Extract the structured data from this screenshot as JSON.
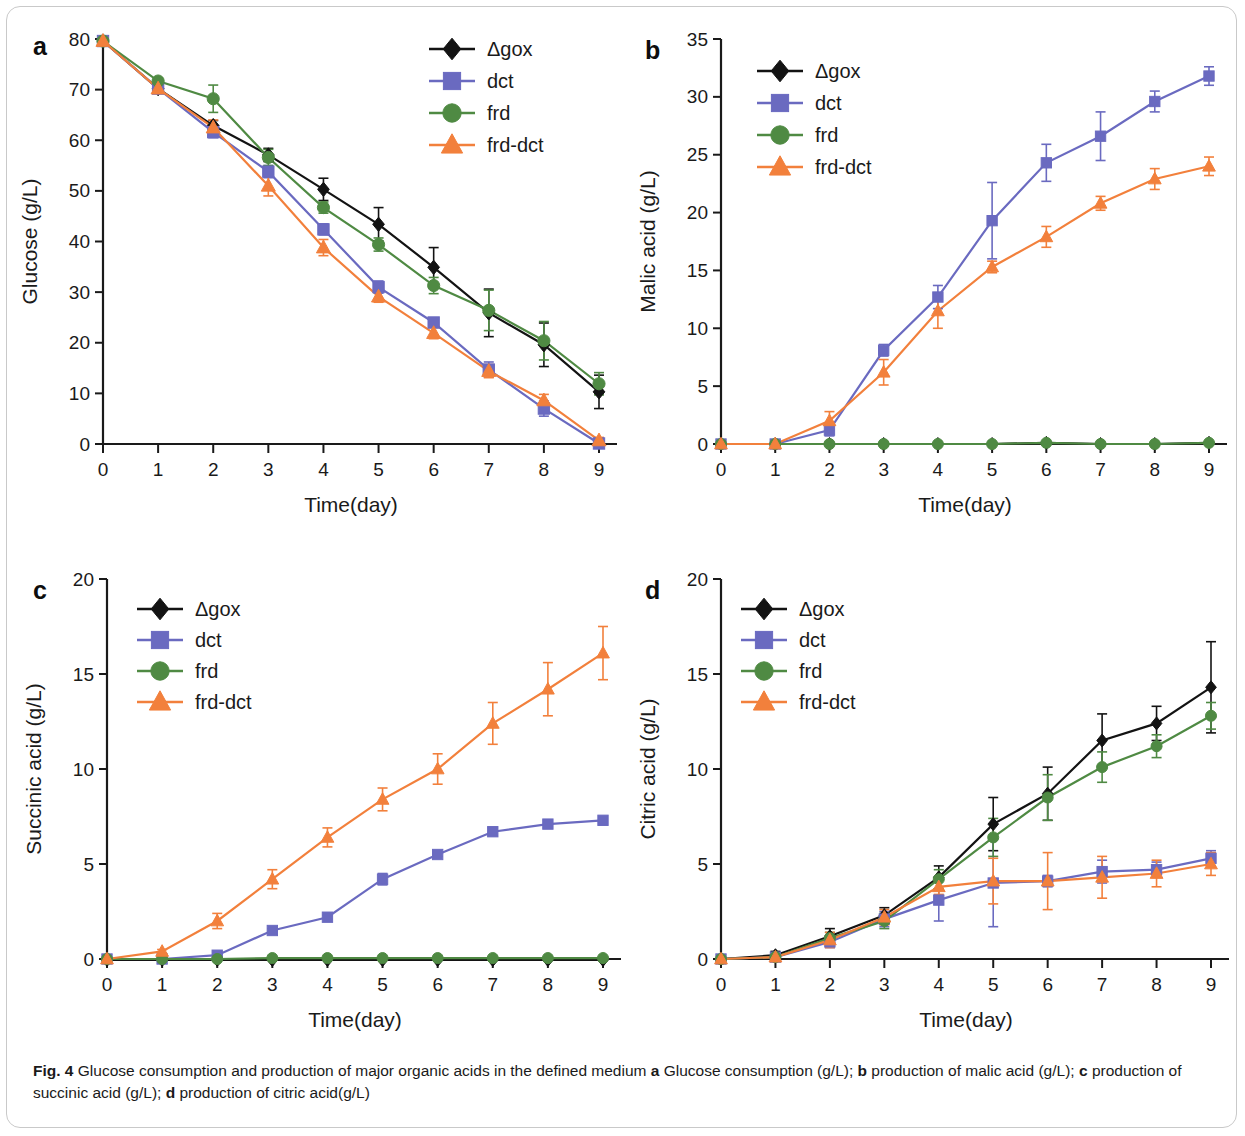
{
  "figure": {
    "label": "Fig. 4",
    "caption_parts": [
      {
        "text": "Fig. 4",
        "bold": true
      },
      {
        "text": " Glucose consumption and production of major organic acids in the defined medium ",
        "bold": false
      },
      {
        "text": "a",
        "bold": true
      },
      {
        "text": " Glucose consumption (g/L); ",
        "bold": false
      },
      {
        "text": "b",
        "bold": true
      },
      {
        "text": " production of malic acid (g/L); ",
        "bold": false
      },
      {
        "text": "c",
        "bold": true
      },
      {
        "text": " production of succinic acid (g/L); ",
        "bold": false
      },
      {
        "text": "d",
        "bold": true
      },
      {
        "text": " production of citric acid(g/L)",
        "bold": false
      }
    ],
    "caption_full": "Fig. 4 Glucose consumption and production of major organic acids in the defined medium a Glucose consumption (g/L); b production of malic acid (g/L); c production of succinic acid (g/L); d production of citric acid(g/L)"
  },
  "colors": {
    "dgox": "#131313",
    "dct": "#6a6ac0",
    "frd": "#4f8a43",
    "frd_dct": "#f2803c"
  },
  "chart_data": [
    {
      "panel": "a",
      "type": "line",
      "title": "",
      "xlabel": "Time(day)",
      "ylabel": "Glucose (g/L)",
      "x": [
        0,
        1,
        2,
        3,
        4,
        5,
        6,
        7,
        8,
        9
      ],
      "xticks": [
        "0",
        "1",
        "2",
        "3",
        "4",
        "5",
        "6",
        "7",
        "8",
        "9"
      ],
      "yticks": [
        "0",
        "10",
        "20",
        "30",
        "40",
        "50",
        "60",
        "70",
        "80"
      ],
      "xlim": [
        0,
        9
      ],
      "ylim": [
        0,
        80
      ],
      "grid": false,
      "legend_position": "top-right",
      "series": [
        {
          "name": "Δgox",
          "marker": "diamond",
          "color": "#131313",
          "values": [
            79.6,
            70.2,
            62.9,
            57.1,
            50.3,
            43.4,
            34.9,
            25.9,
            19.6,
            10.3
          ],
          "errors": [
            0.4,
            0.6,
            1.0,
            1.3,
            2.2,
            3.3,
            3.9,
            4.7,
            4.3,
            3.3
          ]
        },
        {
          "name": "dct",
          "marker": "square",
          "color": "#6a6ac0",
          "values": [
            79.6,
            70.2,
            61.6,
            53.8,
            42.4,
            31.0,
            24.0,
            14.7,
            7.0,
            0.1
          ],
          "errors": [
            0.4,
            0.6,
            1.1,
            1.2,
            1.1,
            1.2,
            0.9,
            1.5,
            1.5,
            0.5
          ]
        },
        {
          "name": "frd",
          "marker": "circle",
          "color": "#4f8a43",
          "values": [
            79.6,
            71.7,
            68.2,
            56.6,
            46.7,
            39.4,
            31.3,
            26.4,
            20.4,
            11.9
          ],
          "errors": [
            0.4,
            0.6,
            2.7,
            1.6,
            1.1,
            1.3,
            1.6,
            4.0,
            3.8,
            2.2
          ]
        },
        {
          "name": "frd-dct",
          "marker": "triangle",
          "color": "#f2803c",
          "values": [
            79.6,
            70.2,
            62.5,
            51.0,
            38.8,
            29.1,
            21.9,
            14.4,
            8.6,
            0.7
          ],
          "errors": [
            0.4,
            0.6,
            1.5,
            2.0,
            1.6,
            1.1,
            1.1,
            1.3,
            1.2,
            0.6
          ]
        }
      ]
    },
    {
      "panel": "b",
      "type": "line",
      "title": "",
      "xlabel": "Time(day)",
      "ylabel": "Malic acid (g/L)",
      "x": [
        0,
        1,
        2,
        3,
        4,
        5,
        6,
        7,
        8,
        9
      ],
      "xticks": [
        "0",
        "1",
        "2",
        "3",
        "4",
        "5",
        "6",
        "7",
        "8",
        "9"
      ],
      "yticks": [
        "0",
        "5",
        "10",
        "15",
        "20",
        "25",
        "30",
        "35"
      ],
      "xlim": [
        0,
        9
      ],
      "ylim": [
        0,
        35
      ],
      "grid": false,
      "legend_position": "top-left",
      "series": [
        {
          "name": "Δgox",
          "marker": "diamond",
          "color": "#131313",
          "values": [
            0.0,
            0.0,
            0.0,
            0.0,
            0.0,
            0.0,
            0.1,
            0.0,
            0.0,
            0.1
          ],
          "errors": [
            0.05,
            0.05,
            0.05,
            0.05,
            0.05,
            0.05,
            0.05,
            0.05,
            0.05,
            0.05
          ]
        },
        {
          "name": "dct",
          "marker": "square",
          "color": "#6a6ac0",
          "values": [
            0.0,
            0.0,
            1.2,
            8.1,
            12.7,
            19.3,
            24.3,
            26.6,
            29.6,
            31.8
          ],
          "errors": [
            0.05,
            0.05,
            0.5,
            0.5,
            1.0,
            3.3,
            1.6,
            2.1,
            0.9,
            0.8
          ]
        },
        {
          "name": "frd",
          "marker": "circle",
          "color": "#4f8a43",
          "values": [
            0.0,
            0.0,
            0.0,
            0.0,
            0.0,
            0.0,
            0.1,
            0.0,
            0.0,
            0.1
          ],
          "errors": [
            0.05,
            0.05,
            0.05,
            0.05,
            0.05,
            0.05,
            0.05,
            0.05,
            0.05,
            0.05
          ]
        },
        {
          "name": "frd-dct",
          "marker": "triangle",
          "color": "#f2803c",
          "values": [
            0.0,
            0.0,
            2.0,
            6.2,
            11.5,
            15.3,
            17.9,
            20.8,
            22.9,
            24.0
          ],
          "errors": [
            0.05,
            0.05,
            0.8,
            1.1,
            1.5,
            0.5,
            0.9,
            0.6,
            0.9,
            0.8
          ]
        }
      ]
    },
    {
      "panel": "c",
      "type": "line",
      "title": "",
      "xlabel": "Time(day)",
      "ylabel": "Succinic acid (g/L)",
      "x": [
        0,
        1,
        2,
        3,
        4,
        5,
        6,
        7,
        8,
        9
      ],
      "xticks": [
        "0",
        "1",
        "2",
        "3",
        "4",
        "5",
        "6",
        "7",
        "8",
        "9"
      ],
      "yticks": [
        "0",
        "5",
        "10",
        "15",
        "20"
      ],
      "xlim": [
        0,
        9
      ],
      "ylim": [
        0,
        20
      ],
      "grid": false,
      "legend_position": "top-left",
      "series": [
        {
          "name": "Δgox",
          "marker": "diamond",
          "color": "#131313",
          "values": [
            -0.05,
            -0.05,
            -0.05,
            -0.05,
            -0.05,
            -0.05,
            -0.05,
            -0.05,
            -0.05,
            -0.05
          ],
          "errors": [
            0.03,
            0.03,
            0.03,
            0.03,
            0.03,
            0.03,
            0.03,
            0.03,
            0.03,
            0.03
          ]
        },
        {
          "name": "dct",
          "marker": "square",
          "color": "#6a6ac0",
          "values": [
            0.0,
            0.0,
            0.2,
            1.5,
            2.2,
            4.2,
            5.5,
            6.7,
            7.1,
            7.3
          ],
          "errors": [
            0.03,
            0.03,
            0.05,
            0.1,
            0.1,
            0.3,
            0.1,
            0.2,
            0.2,
            0.1
          ]
        },
        {
          "name": "frd",
          "marker": "circle",
          "color": "#4f8a43",
          "values": [
            0.0,
            0.0,
            0.0,
            0.05,
            0.05,
            0.05,
            0.05,
            0.05,
            0.05,
            0.05
          ],
          "errors": [
            0.03,
            0.03,
            0.03,
            0.03,
            0.03,
            0.03,
            0.03,
            0.03,
            0.03,
            0.03
          ]
        },
        {
          "name": "frd-dct",
          "marker": "triangle",
          "color": "#f2803c",
          "values": [
            0.0,
            0.4,
            2.0,
            4.2,
            6.4,
            8.4,
            10.0,
            12.4,
            14.2,
            16.1
          ],
          "errors": [
            0.03,
            0.1,
            0.4,
            0.5,
            0.5,
            0.6,
            0.8,
            1.1,
            1.4,
            1.4
          ]
        }
      ]
    },
    {
      "panel": "d",
      "type": "line",
      "title": "",
      "xlabel": "Time(day)",
      "ylabel": "Citric acid (g/L)",
      "x": [
        0,
        1,
        2,
        3,
        4,
        5,
        6,
        7,
        8,
        9
      ],
      "xticks": [
        "0",
        "1",
        "2",
        "3",
        "4",
        "5",
        "6",
        "7",
        "8",
        "9"
      ],
      "yticks": [
        "0",
        "5",
        "10",
        "15",
        "20"
      ],
      "xlim": [
        0,
        9
      ],
      "ylim": [
        0,
        20
      ],
      "grid": false,
      "legend_position": "top-left",
      "series": [
        {
          "name": "Δgox",
          "marker": "diamond",
          "color": "#131313",
          "values": [
            0.0,
            0.2,
            1.2,
            2.3,
            4.3,
            7.1,
            8.7,
            11.5,
            12.4,
            14.3
          ],
          "errors": [
            0.05,
            0.2,
            0.4,
            0.4,
            0.6,
            1.4,
            1.4,
            1.4,
            0.9,
            2.4
          ]
        },
        {
          "name": "dct",
          "marker": "square",
          "color": "#6a6ac0",
          "values": [
            0.0,
            0.1,
            0.9,
            2.1,
            3.1,
            4.0,
            4.1,
            4.6,
            4.7,
            5.3
          ],
          "errors": [
            0.05,
            0.1,
            0.3,
            0.4,
            1.1,
            2.3,
            0.3,
            0.6,
            0.4,
            0.4
          ]
        },
        {
          "name": "frd",
          "marker": "circle",
          "color": "#4f8a43",
          "values": [
            0.0,
            0.1,
            1.1,
            2.0,
            4.2,
            6.4,
            8.5,
            10.1,
            11.2,
            12.8
          ],
          "errors": [
            0.05,
            0.2,
            0.3,
            0.4,
            0.5,
            1.0,
            1.2,
            0.8,
            0.6,
            0.7
          ]
        },
        {
          "name": "frd-dct",
          "marker": "triangle",
          "color": "#f2803c",
          "values": [
            0.0,
            0.1,
            1.0,
            2.2,
            3.8,
            4.1,
            4.1,
            4.3,
            4.5,
            5.0
          ],
          "errors": [
            0.05,
            0.2,
            0.4,
            0.4,
            0.4,
            1.2,
            1.5,
            1.1,
            0.7,
            0.6
          ]
        }
      ]
    }
  ]
}
